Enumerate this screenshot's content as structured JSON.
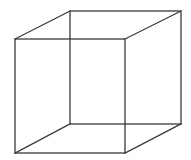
{
  "diagram": {
    "type": "wireframe-cube",
    "name": "Necker cube",
    "stroke_color": "#3a3a3a",
    "background": "#ffffff",
    "vertices": {
      "front_top_left": [
        15,
        39
      ],
      "front_top_right": [
        125,
        39
      ],
      "front_bottom_left": [
        15,
        153
      ],
      "front_bottom_right": [
        125,
        153
      ],
      "back_top_left": [
        70,
        11
      ],
      "back_top_right": [
        181,
        11
      ],
      "back_bottom_left": [
        70,
        124
      ],
      "back_bottom_right": [
        181,
        124
      ]
    }
  }
}
